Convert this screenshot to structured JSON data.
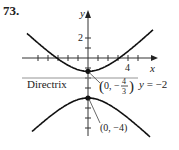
{
  "problem_number": "73.",
  "chart_data": {
    "type": "line",
    "title": "",
    "xlabel": "x",
    "ylabel": "y",
    "xlim": [
      -6,
      7
    ],
    "ylim": [
      -8,
      4.5
    ],
    "x_ticks": [
      -5,
      -4,
      -3,
      -2,
      -1,
      1,
      2,
      3,
      4,
      5
    ],
    "x_tick_labels": [
      {
        "value": 4,
        "label": "4"
      }
    ],
    "y_ticks": [
      2,
      1,
      -1,
      -2,
      -3,
      -4,
      -5,
      -6,
      -7
    ],
    "y_tick_labels": [
      {
        "value": 2,
        "label": "2"
      }
    ],
    "grid": false,
    "series": [
      {
        "name": "upper parabola",
        "equation": "x^2 = 12(y + 4/3) scaled",
        "vertex": [
          0,
          -1.3333
        ],
        "opens": "up",
        "x": [
          -6,
          -4,
          -2,
          0,
          2,
          4,
          6
        ],
        "y": [
          1.0,
          -0.3,
          -1.0,
          -1.3333,
          -1.0,
          -0.3,
          1.0
        ]
      },
      {
        "name": "lower parabola",
        "vertex": [
          0,
          -4
        ],
        "opens": "down",
        "x": [
          -6,
          -4,
          -2,
          0,
          2,
          4,
          6
        ],
        "y": [
          -6.6,
          -5.3,
          -4.4,
          -4,
          -4.4,
          -5.3,
          -6.6
        ]
      }
    ],
    "lines": [
      {
        "name": "directrix",
        "y": -2,
        "label": "Directrix",
        "eq_label": "y = −2"
      }
    ],
    "points": [
      {
        "x": 0,
        "y": -1.3333,
        "label_prefix": "(0, −",
        "label_num": "4",
        "label_den": "3",
        "label_suffix": ")"
      },
      {
        "x": 0,
        "y": -4,
        "label": "(0, −4)"
      }
    ],
    "annotations": {
      "directrix_text": "Directrix",
      "directrix_eq": "y = −2",
      "vertex_upper": "(0, −4/3)",
      "vertex_lower": "(0, −4)"
    }
  }
}
